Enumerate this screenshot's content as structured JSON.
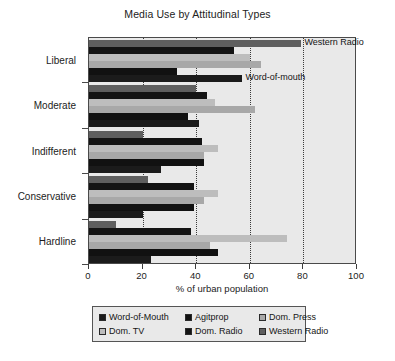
{
  "chart_data": {
    "type": "bar",
    "orientation": "horizontal",
    "title": "Media Use by Attitudinal Types",
    "xlabel": "% of urban population",
    "ylabel": "",
    "xlim": [
      0,
      100
    ],
    "xticks": [
      0,
      20,
      40,
      60,
      80,
      100
    ],
    "xticklabels": [
      "0",
      "20",
      "40",
      "60",
      "80",
      "100"
    ],
    "grid": "vertical-dotted",
    "legend_position": "below",
    "categories": [
      "Liberal",
      "Moderate",
      "Indifferent",
      "Conservative",
      "Hardline"
    ],
    "series": [
      {
        "name": "Word-of-Mouth",
        "color": "#1b1b1b",
        "values": [
          57,
          41,
          27,
          20,
          23
        ]
      },
      {
        "name": "Agitprop",
        "color": "#111111",
        "values": [
          33,
          37,
          43,
          39,
          48
        ]
      },
      {
        "name": "Dom. Press",
        "color": "#a8a8a8",
        "values": [
          64,
          62,
          43,
          43,
          45
        ]
      },
      {
        "name": "Dom. TV",
        "color": "#bdbdbd",
        "values": [
          60,
          47,
          48,
          48,
          74
        ]
      },
      {
        "name": "Dom. Radio",
        "color": "#141414",
        "values": [
          54,
          44,
          42,
          39,
          38
        ]
      },
      {
        "name": "Western Radio",
        "color": "#5f5f5f",
        "values": [
          79,
          40,
          20,
          22,
          10
        ]
      }
    ],
    "annotations": [
      {
        "text": "Western Radio",
        "x": 80,
        "category": "Liberal",
        "series": "Western Radio"
      },
      {
        "text": "Word-of-mouth",
        "x": 58,
        "category": "Liberal",
        "series": "Word-of-Mouth"
      }
    ]
  },
  "legend": {
    "rows": [
      [
        {
          "label": "Word-of-Mouth",
          "color": "#1b1b1b"
        },
        {
          "label": "Agitprop",
          "color": "#111111"
        },
        {
          "label": "Dom. Press",
          "color": "#a8a8a8"
        }
      ],
      [
        {
          "label": "Dom. TV",
          "color": "#bdbdbd"
        },
        {
          "label": "Dom. Radio",
          "color": "#141414"
        },
        {
          "label": "Western Radio",
          "color": "#5f5f5f"
        }
      ]
    ]
  }
}
